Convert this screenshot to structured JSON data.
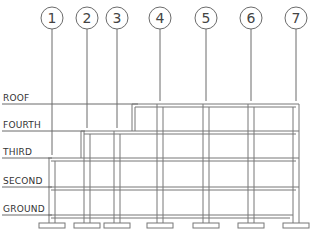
{
  "diagram": {
    "type": "building elevation / structural grid",
    "grid_lines": [
      {
        "label": "1",
        "x": 52
      },
      {
        "label": "2",
        "x": 87
      },
      {
        "label": "3",
        "x": 117
      },
      {
        "label": "4",
        "x": 160
      },
      {
        "label": "5",
        "x": 206
      },
      {
        "label": "6",
        "x": 251
      },
      {
        "label": "7",
        "x": 296
      }
    ],
    "levels": [
      {
        "label": "ROOF",
        "y": 104
      },
      {
        "label": "FOURTH",
        "y": 131
      },
      {
        "label": "THIRD",
        "y": 158
      },
      {
        "label": "SECOND",
        "y": 187
      },
      {
        "label": "GROUND",
        "y": 215
      }
    ],
    "colors": {
      "line": "#6b6b6b",
      "text": "#333333",
      "background": "#ffffff"
    }
  }
}
